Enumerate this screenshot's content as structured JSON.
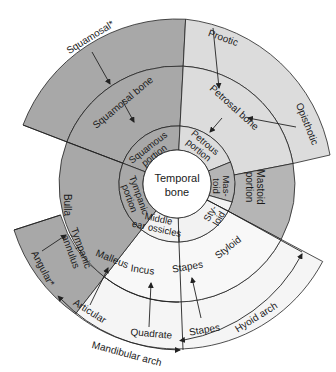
{
  "colors": {
    "dark_gray": "#a6a6a6",
    "mid_gray": "#b3b3b3",
    "light_gray": "#d9d9d9",
    "pale": "#f2f2f2",
    "white": "#ffffff",
    "line": "#222222"
  },
  "center": {
    "line1": "Temporal",
    "line2": "bone"
  },
  "inner_ring": {
    "squamous_portion": {
      "line1": "Squamous",
      "line2": "portion"
    },
    "petrous_portion": {
      "line1": "Petrous",
      "line2": "portion"
    },
    "mastoid": {
      "line1": "Mas-",
      "line2": "toid"
    },
    "styloid": {
      "line1": "Sty-",
      "line2": "loid"
    },
    "middle_ear": {
      "line1": "Middle",
      "line2": "ear ossicles"
    },
    "tympanic_portion": {
      "line1": "Tympanic",
      "line2": "portion"
    }
  },
  "middle_ring": {
    "squamosal_bone": "Squamosal bone",
    "petrosal_bone": "Petrosal bone",
    "mastoid_portion": {
      "line1": "Mastoid",
      "line2": "portion"
    },
    "styloid": "Styloid",
    "stapes": "Stapes",
    "incus": "Incus",
    "malleus": "Malleus",
    "bulla": "Bulla",
    "tympanic_annulus": {
      "line1": "Tympanic",
      "line2": "annulus"
    }
  },
  "outer_ring": {
    "squamosal": "Squamosal*",
    "prootic": "Prootic",
    "opisthotic": "Opisthotic",
    "angular": "Angular*",
    "articular": "Articular",
    "quadrate": "Quadrate",
    "stapes": "Stapes"
  },
  "arches": {
    "mandibular": "Mandibular arch",
    "hyoid": "Hyoid arch"
  }
}
